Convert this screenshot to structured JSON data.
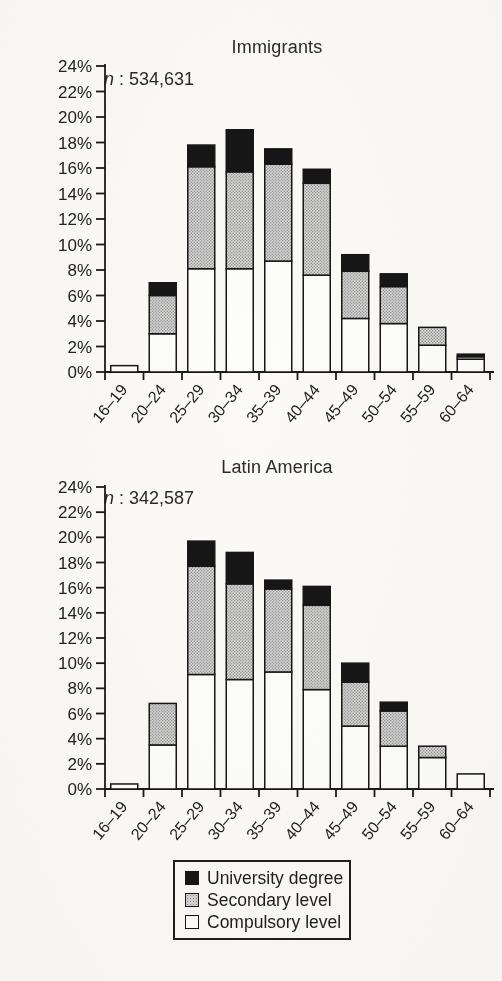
{
  "page": {
    "background_color": "#fbfaf7",
    "figure_type": "scanned stacked bar charts"
  },
  "chart_data": [
    {
      "type": "bar",
      "stacked": true,
      "title": "Immigrants",
      "annotation": "n : 534,631",
      "categories": [
        "16–19",
        "20–24",
        "25–29",
        "30–34",
        "35–39",
        "40–44",
        "45–49",
        "50–54",
        "55–59",
        "60–64"
      ],
      "series": [
        {
          "name": "Compulsory level",
          "values": [
            0.5,
            3.0,
            8.1,
            8.1,
            8.7,
            7.6,
            4.2,
            3.8,
            2.1,
            1.0
          ]
        },
        {
          "name": "Secondary level",
          "values": [
            0,
            3.0,
            8.0,
            7.6,
            7.6,
            7.2,
            3.7,
            2.9,
            1.4,
            0.2
          ]
        },
        {
          "name": "University degree",
          "values": [
            0,
            1.0,
            1.7,
            3.3,
            1.2,
            1.1,
            1.3,
            1.0,
            0,
            0.2
          ]
        }
      ],
      "totals": [
        0.5,
        7.0,
        17.8,
        19.0,
        17.5,
        15.9,
        9.2,
        7.7,
        3.5,
        1.4
      ],
      "xlabel": "",
      "ylabel": "",
      "ylim": [
        0,
        24
      ],
      "ytick_step": 2,
      "yticks": [
        "0%",
        "2%",
        "4%",
        "6%",
        "8%",
        "10%",
        "12%",
        "14%",
        "16%",
        "18%",
        "20%",
        "22%",
        "24%"
      ],
      "grid": false,
      "legend_position": "shared-bottom"
    },
    {
      "type": "bar",
      "stacked": true,
      "title": "Latin America",
      "annotation": "n : 342,587",
      "categories": [
        "16–19",
        "20–24",
        "25–29",
        "30–34",
        "35–39",
        "40–44",
        "45–49",
        "50–54",
        "55–59",
        "60–64"
      ],
      "series": [
        {
          "name": "Compulsory level",
          "values": [
            0.4,
            3.5,
            9.1,
            8.7,
            9.3,
            7.9,
            5.0,
            3.4,
            2.5,
            1.2
          ]
        },
        {
          "name": "Secondary level",
          "values": [
            0,
            3.3,
            8.6,
            7.6,
            6.6,
            6.7,
            3.5,
            2.8,
            0.9,
            0
          ]
        },
        {
          "name": "University degree",
          "values": [
            0,
            0,
            2.0,
            2.5,
            0.7,
            1.5,
            1.5,
            0.7,
            0,
            0
          ]
        }
      ],
      "totals": [
        0.4,
        6.8,
        19.7,
        18.8,
        16.6,
        16.1,
        10.0,
        6.9,
        3.4,
        1.2
      ],
      "xlabel": "",
      "ylabel": "",
      "ylim": [
        0,
        24
      ],
      "ytick_step": 2,
      "yticks": [
        "0%",
        "2%",
        "4%",
        "6%",
        "8%",
        "10%",
        "12%",
        "14%",
        "16%",
        "18%",
        "20%",
        "22%",
        "24%"
      ],
      "grid": false,
      "legend_position": "shared-bottom"
    }
  ],
  "legend": {
    "items": [
      {
        "label": "University degree",
        "color": "#161616",
        "style": "solid-black"
      },
      {
        "label": "Secondary level",
        "color": "#c4c4c4",
        "style": "gray-halftone"
      },
      {
        "label": "Compulsory level",
        "color": "#ffffff",
        "style": "white"
      }
    ]
  }
}
